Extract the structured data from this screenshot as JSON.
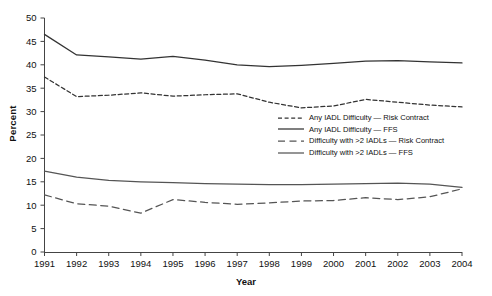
{
  "chart_data": {
    "type": "line",
    "title": "",
    "xlabel": "Year",
    "ylabel": "Percent",
    "grid": false,
    "legend_position": "inside-center-right",
    "x": [
      1991,
      1992,
      1993,
      1994,
      1995,
      1996,
      1997,
      1998,
      1999,
      2000,
      2001,
      2002,
      2003,
      2004
    ],
    "xtick_labels": [
      "1991",
      "1992",
      "1993",
      "1994",
      "1995",
      "1996",
      "1997",
      "1998",
      "1999",
      "2000",
      "2001",
      "2002",
      "2003",
      "2004"
    ],
    "ytick_labels": [
      "0",
      "5",
      "10",
      "15",
      "20",
      "25",
      "30",
      "35",
      "40",
      "45",
      "50"
    ],
    "yticks": [
      0,
      5,
      10,
      15,
      20,
      25,
      30,
      35,
      40,
      45,
      50
    ],
    "ylim": [
      0,
      50
    ],
    "xlim": [
      1991,
      2004
    ],
    "series": [
      {
        "name": "Any IADL Difficulty — Risk Contract",
        "style": "dashed",
        "color": "#333333",
        "values": [
          37.4,
          33.2,
          33.5,
          34.0,
          33.3,
          33.6,
          33.8,
          32.0,
          30.8,
          31.2,
          32.6,
          32.0,
          31.4,
          31.0
        ]
      },
      {
        "name": "Any IADL Difficulty — FFS",
        "style": "solid",
        "color": "#333333",
        "values": [
          46.5,
          42.1,
          41.7,
          41.2,
          41.8,
          41.0,
          40.0,
          39.6,
          39.9,
          40.3,
          40.8,
          40.9,
          40.6,
          40.4
        ]
      },
      {
        "name": "Difficulty with >2 IADLs — Risk Contract",
        "style": "long-dashed",
        "color": "#555555",
        "values": [
          12.2,
          10.3,
          9.8,
          8.3,
          11.2,
          10.6,
          10.2,
          10.5,
          10.9,
          11.0,
          11.6,
          11.2,
          11.8,
          13.5
        ]
      },
      {
        "name": "Difficulty with >2 IADLs — FFS",
        "style": "solid",
        "color": "#555555",
        "values": [
          17.3,
          16.0,
          15.3,
          15.0,
          14.8,
          14.6,
          14.5,
          14.4,
          14.4,
          14.5,
          14.6,
          14.7,
          14.5,
          13.8
        ]
      }
    ]
  }
}
